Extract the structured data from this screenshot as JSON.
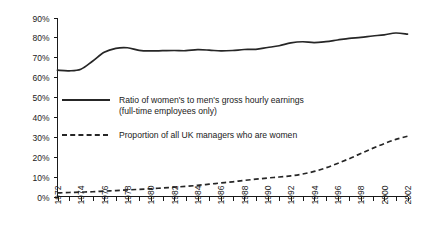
{
  "chart_data": {
    "type": "line",
    "title": "",
    "subtitle": "",
    "xlabel": "",
    "ylabel": "",
    "xlim": [
      1972,
      2002
    ],
    "ylim": [
      0,
      90
    ],
    "grid": false,
    "legend_position": "inside-left",
    "y_ticks": [
      "0%",
      "10%",
      "20%",
      "30%",
      "40%",
      "50%",
      "60%",
      "70%",
      "80%",
      "90%"
    ],
    "y_tick_values": [
      0,
      10,
      20,
      30,
      40,
      50,
      60,
      70,
      80,
      90
    ],
    "x_ticks": [
      "1972",
      "1974",
      "1976",
      "1978",
      "1980",
      "1982",
      "1984",
      "1986",
      "1988",
      "1990",
      "1992",
      "1994",
      "1996",
      "1998",
      "2000",
      "2002"
    ],
    "x_tick_values": [
      1972,
      1974,
      1976,
      1978,
      1980,
      1982,
      1984,
      1986,
      1988,
      1990,
      1992,
      1994,
      1996,
      1998,
      2000,
      2002
    ],
    "x": [
      1972,
      1973,
      1974,
      1975,
      1976,
      1977,
      1978,
      1979,
      1980,
      1981,
      1982,
      1983,
      1984,
      1985,
      1986,
      1987,
      1988,
      1989,
      1990,
      1991,
      1992,
      1993,
      1994,
      1995,
      1996,
      1997,
      1998,
      1999,
      2000,
      2001,
      2002
    ],
    "series": [
      {
        "name": "Ratio of women's to men's gross hourly earnings (full-time employees only)",
        "style": "solid",
        "values": [
          63.5,
          63.2,
          64.0,
          68.0,
          72.5,
          74.5,
          74.8,
          73.5,
          73.2,
          73.3,
          73.4,
          73.3,
          73.8,
          73.6,
          73.2,
          73.4,
          73.9,
          74.0,
          74.9,
          75.8,
          77.2,
          77.8,
          77.4,
          77.9,
          78.7,
          79.5,
          80.0,
          80.7,
          81.3,
          82.2,
          81.6
        ]
      },
      {
        "name": "Proportion of all UK managers who are women",
        "style": "dashed",
        "values": [
          1.8,
          2.0,
          2.2,
          2.4,
          2.7,
          3.0,
          3.3,
          3.6,
          3.9,
          4.3,
          4.7,
          5.1,
          5.6,
          6.2,
          6.8,
          7.4,
          8.1,
          8.7,
          9.3,
          9.8,
          10.4,
          11.3,
          12.6,
          14.4,
          16.6,
          19.0,
          21.6,
          24.2,
          26.6,
          28.7,
          30.3
        ]
      }
    ],
    "legend": [
      {
        "style": "solid",
        "line1": "Ratio of women's to men's gross hourly earnings",
        "line2": "(full-time employees only)"
      },
      {
        "style": "dashed",
        "line1": "Proportion of all UK managers who are women",
        "line2": ""
      }
    ]
  }
}
